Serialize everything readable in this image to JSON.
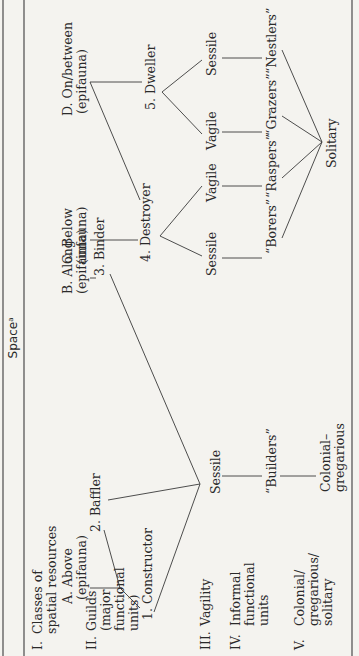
{
  "header": {
    "title": "Space",
    "title_superscript": "a"
  },
  "row_labels": [
    {
      "numeral": "I.",
      "lines": [
        "Classes of",
        "spatial resources"
      ]
    },
    {
      "numeral": "II.",
      "lines": [
        "Guilds",
        "(major",
        "functional",
        "units)"
      ]
    },
    {
      "numeral": "III.",
      "lines": [
        "Vagility"
      ]
    },
    {
      "numeral": "IV.",
      "lines": [
        "Informal",
        "functional",
        "units"
      ]
    },
    {
      "numeral": "V.",
      "lines": [
        "Colonial/",
        "gregarious/",
        "solitary"
      ]
    }
  ],
  "spatial_classes": [
    {
      "label": "A. Above",
      "sub": "(epifauna)"
    },
    {
      "label": "B. Along",
      "sub": "(epifauna)"
    },
    {
      "label": "C. Below",
      "sub": "(infauna)"
    },
    {
      "label": "D. On/between",
      "sub": "(epifauna)"
    }
  ],
  "guilds": [
    {
      "label": "1. Constructor"
    },
    {
      "label": "2. Baffler"
    },
    {
      "label": "3. Binder"
    },
    {
      "label": "4. Destroyer"
    },
    {
      "label": "5. Dweller"
    }
  ],
  "vagility": {
    "builders_group": "Sessile",
    "destroyer_sessile": "Sessile",
    "destroyer_vagile": "Vagile",
    "dweller_vagile": "Vagile",
    "dweller_sessile": "Sessile"
  },
  "informal_units": {
    "builders": "“Builders”",
    "borers": "“Borers”",
    "raspers": "“Raspers”",
    "grazers": "“Grazers”",
    "nestlers": "“Nestlers”"
  },
  "colonial": {
    "colonial_gregarious_1": "Colonial–",
    "colonial_gregarious_2": "gregarious",
    "solitary": "Solitary"
  }
}
